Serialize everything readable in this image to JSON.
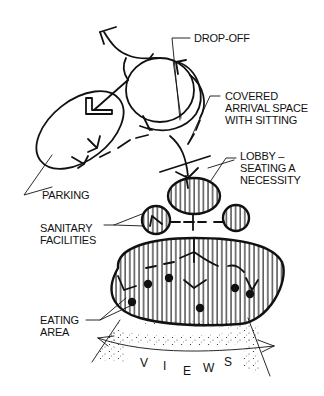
{
  "diagram": {
    "type": "architectural bubble diagram",
    "background": "#ffffff",
    "ink_color": "#111111",
    "labels": {
      "drop_off": "DROP-OFF",
      "covered_1": "COVERED",
      "covered_2": "ARRIVAL SPACE",
      "covered_3": "WITH SITTING",
      "lobby_1": "LOBBY –",
      "lobby_2": "SEATING A",
      "lobby_3": "NECESSITY",
      "parking": "PARKING",
      "sanitary_1": "SANITARY",
      "sanitary_2": "FACILITIES",
      "eating_1": "EATING",
      "eating_2": "AREA",
      "views": [
        "V",
        "I",
        "E",
        "W",
        "S"
      ]
    },
    "nodes": [
      {
        "id": "drop-off",
        "shape": "circle"
      },
      {
        "id": "parking",
        "shape": "ellipse"
      },
      {
        "id": "covered-arrival",
        "shape": "crescent"
      },
      {
        "id": "lobby",
        "shape": "hatched-ellipse"
      },
      {
        "id": "sanitary-left",
        "shape": "hatched-circle"
      },
      {
        "id": "sanitary-right",
        "shape": "hatched-circle"
      },
      {
        "id": "eating-area",
        "shape": "hatched-blob"
      },
      {
        "id": "views",
        "shape": "stippled-fan"
      }
    ]
  }
}
